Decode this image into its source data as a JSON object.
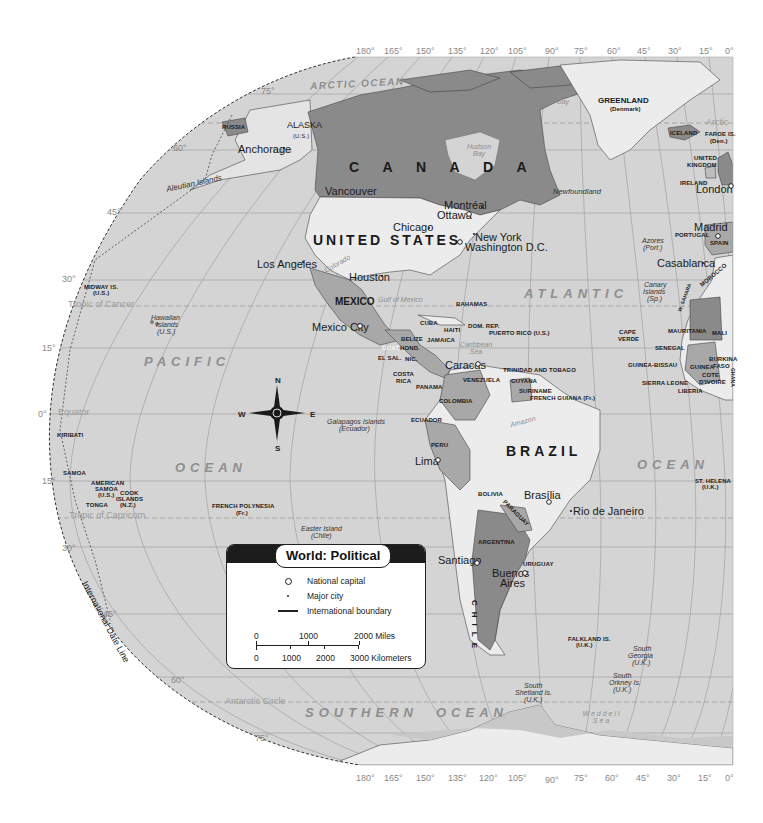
{
  "title": "World: Political",
  "legend": {
    "title": "World: Political",
    "items": [
      {
        "symbol": "open-circle",
        "label": "National capital"
      },
      {
        "symbol": "dot",
        "label": "Major city"
      },
      {
        "symbol": "line",
        "label": "International boundary"
      }
    ],
    "scale": {
      "miles": [
        "0",
        "1000",
        "2000 Miles"
      ],
      "kilometers": [
        "0",
        "1000",
        "2000",
        "3000 Kilometers"
      ]
    }
  },
  "longitude_labels": [
    "180°",
    "165°",
    "150°",
    "135°",
    "120°",
    "105°",
    "90°",
    "75°",
    "60°",
    "45°",
    "30°",
    "15°",
    "0°"
  ],
  "latitude_labels": {
    "north": [
      "75°",
      "60°",
      "45°",
      "30°",
      "15°",
      "0°"
    ],
    "south": [
      "15°",
      "30°",
      "45°",
      "60°",
      "75°"
    ]
  },
  "reference_lines": {
    "tropic_cancer": "Tropic of Cancer",
    "equator": "Equator",
    "tropic_capricorn": "Tropic of Capricorn",
    "antarctic_circle": "Antarctic Circle",
    "arctic": "Arctic",
    "date_line": "International Date Line"
  },
  "oceans": {
    "arctic": "ARCTIC OCEAN",
    "pacific_1": "PACIFIC",
    "pacific_2": "OCEAN",
    "atlantic_1": "ATLANTIC",
    "atlantic_2": "OCEAN",
    "southern_1": "SOUTHERN",
    "southern_2": "OCEAN"
  },
  "water_bodies": {
    "hudson_bay": "Hudson Bay",
    "baffin_bay": "Baffin Bay",
    "gulf_mexico": "Gulf of Mexico",
    "caribbean": "Caribbean Sea",
    "weddell": "Weddell Sea",
    "amazon": "Amazon",
    "yukon": "Yukon",
    "colorado": "Colorado"
  },
  "countries_large": {
    "canada": "C A N A D A",
    "usa": "UNITED STATES",
    "brazil": "BRAZIL",
    "mexico": "MEXICO",
    "chile": "CHILE"
  },
  "countries": {
    "russia": "RUSSIA",
    "alaska": "ALASKA",
    "alaska_sub": "(U.S.)",
    "greenland": "GREENLAND",
    "greenland_sub": "(Denmark)",
    "iceland": "ICELAND",
    "faroe": "FAROE IS.",
    "faroe_sub": "(Den.)",
    "uk_1": "UNITED",
    "uk_2": "KINGDOM",
    "ireland": "IRELAND",
    "portugal": "PORTUGAL",
    "spain": "SPAIN",
    "morocco": "MOROCCO",
    "w_sahara": "W. SAHARA",
    "mauritania": "MAURITANIA",
    "mali": "MALI",
    "cape_verde_1": "CAPE",
    "cape_verde_2": "VERDE",
    "senegal": "SENEGAL",
    "guinea_bissau": "GUINEA-BISSAU",
    "guinea": "GUINEA",
    "sierra_leone": "SIERRA LEONE",
    "liberia": "LIBERIA",
    "burkina_1": "BURKINA",
    "burkina_2": "FASO",
    "cote_1": "COTE",
    "cote_2": "D'IVOIRE",
    "ghana": "GHANA",
    "midway": "MIDWAY IS.",
    "midway_sub": "(U.S.)",
    "kiribati": "KIRIBATI",
    "samoa": "SAMOA",
    "am_samoa_1": "AMERICAN",
    "am_samoa_2": "SAMOA",
    "am_samoa_3": "(U.S.)",
    "cook_1": "COOK",
    "cook_2": "ISLANDS",
    "cook_3": "(N.Z.)",
    "tonga": "TONGA",
    "fr_polynesia": "FRENCH POLYNESIA",
    "fr_polynesia_sub": "(Fr.)",
    "bahamas": "BAHAMAS",
    "cuba": "CUBA",
    "haiti": "HAITI",
    "dom_rep": "DOM. REP.",
    "puerto_rico": "PUERTO RICO (U.S.)",
    "jamaica": "JAMAICA",
    "belize": "BELIZE",
    "guat": "GUAT.",
    "hond": "HOND.",
    "el_sal": "EL SAL.",
    "nic": "NIC.",
    "costa_1": "COSTA",
    "costa_2": "RICA",
    "panama": "PANAMA",
    "trinidad": "TRINIDAD AND TOBAGO",
    "venezuela": "VENEZUELA",
    "guyana": "GUYANA",
    "suriname": "SURINAME",
    "fr_guiana": "FRENCH GUIANA (Fr.)",
    "colombia": "COLOMBIA",
    "ecuador": "ECUADOR",
    "peru": "PERU",
    "bolivia": "BOLIVIA",
    "paraguay": "PARAGUAY",
    "argentina": "ARGENTINA",
    "uruguay": "URUGUAY",
    "falkland": "FALKLAND IS.",
    "falkland_sub": "(U.K.)",
    "st_helena": "ST. HELENA",
    "st_helena_sub": "(U.K.)"
  },
  "islands": {
    "aleutian": "Aleutian Islands",
    "hawaiian_1": "Hawaiian",
    "hawaiian_2": "Islands",
    "hawaiian_3": "(U.S.)",
    "galapagos_1": "Galapagos Islands",
    "galapagos_2": "(Ecuador)",
    "easter_1": "Easter Island",
    "easter_2": "(Chile)",
    "azores_1": "Azores",
    "azores_2": "(Port.)",
    "canary_1": "Canary",
    "canary_2": "Islands",
    "canary_3": "(Sp.)",
    "newfoundland": "Newfoundland",
    "s_georgia_1": "South",
    "s_georgia_2": "Georgia",
    "s_georgia_3": "(U.K.)",
    "s_orkney_1": "South",
    "s_orkney_2": "Orkney Is.",
    "s_orkney_3": "(U.K.)",
    "s_shetland_1": "South",
    "s_shetland_2": "Shetland Is.",
    "s_shetland_3": "(U.K.)"
  },
  "cities": {
    "anchorage": "Anchorage",
    "vancouver": "Vancouver",
    "montreal": "Montréal",
    "ottawa": "Ottawa",
    "chicago": "Chicago",
    "new_york": "New York",
    "washington": "Washington D.C.",
    "los_angeles": "Los Angeles",
    "houston": "Houston",
    "mexico_city": "Mexico City",
    "caracas": "Caracas",
    "lima": "Lima",
    "brasilia": "Brasília",
    "rio": "Rio de Janeiro",
    "santiago": "Santiago",
    "buenos_1": "Buenos",
    "buenos_2": "Aires",
    "london": "London",
    "madrid": "Madrid",
    "casablanca": "Casablanca"
  },
  "compass": {
    "n": "N",
    "s": "S",
    "e": "E",
    "w": "W"
  },
  "colors": {
    "ocean": "#d4d4d4",
    "land_light": "#ececec",
    "land_dark": "#8a8a8a",
    "land_mid": "#a8a8a8",
    "border": "#1a1a1a",
    "grid": "#9c9c9c"
  }
}
